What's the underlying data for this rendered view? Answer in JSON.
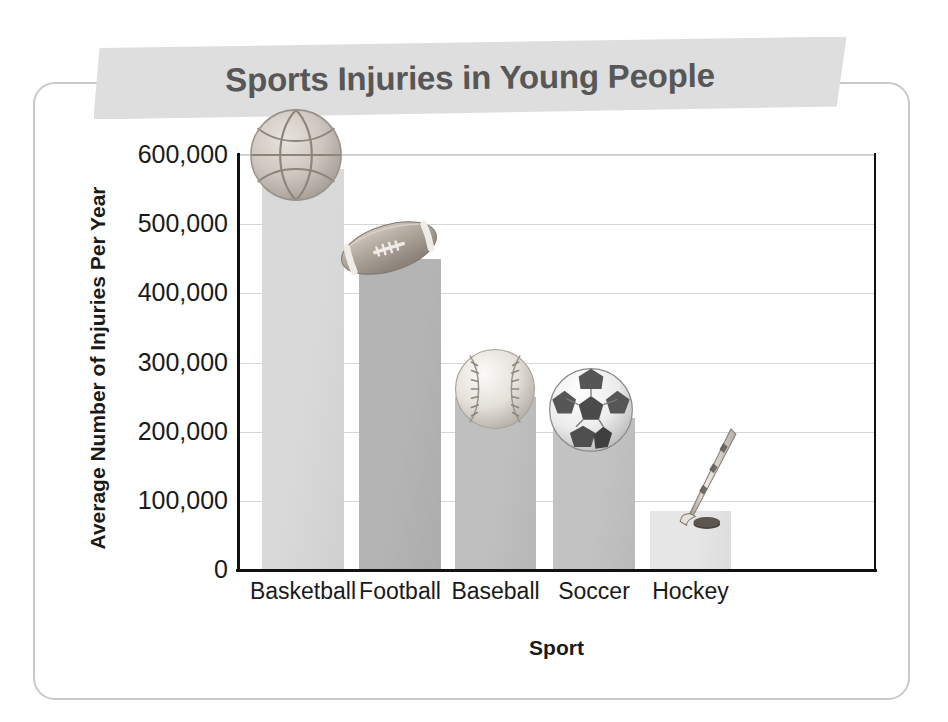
{
  "figure": {
    "title": "Sports Injuries in Young People",
    "title_bg_color": "#dedede",
    "title_color": "#575757",
    "frame_color": "#c9c9c9",
    "background": "#ffffff"
  },
  "chart_data": {
    "type": "bar",
    "title": "Sports Injuries in Young People",
    "xlabel": "Sport",
    "ylabel": "Average Number of Injuries Per Year",
    "categories": [
      "Basketball",
      "Football",
      "Baseball",
      "Soccer",
      "Hockey"
    ],
    "values": [
      580000,
      450000,
      250000,
      220000,
      85000
    ],
    "ylim": [
      0,
      600000
    ],
    "ytick_values": [
      0,
      100000,
      200000,
      300000,
      400000,
      500000,
      600000
    ],
    "ytick_labels": [
      "0",
      "100,000",
      "200,000",
      "300,000",
      "400,000",
      "500,000",
      "600,000"
    ],
    "grid": true,
    "legend": null,
    "bar_colors": [
      "#d9d9d9",
      "#b4b4b4",
      "#bfbfbf",
      "#c2c2c2",
      "#e6e6e6"
    ],
    "bar_icons": [
      "basketball-icon",
      "football-icon",
      "baseball-icon",
      "soccer-ball-icon",
      "hockey-stick-icon"
    ],
    "gridline_color": "#d6d6d6",
    "axis_color": "#111111"
  }
}
